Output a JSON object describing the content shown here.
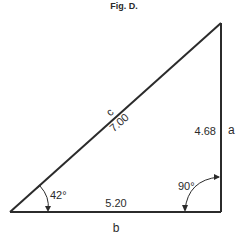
{
  "figure": {
    "title": "Fig. D."
  },
  "triangle": {
    "hypotenuse": {
      "letter": "c",
      "value": "7.00"
    },
    "vertical_side": {
      "letter": "a",
      "value": "4.68"
    },
    "base": {
      "letter": "b",
      "value": "5.20"
    },
    "angle_left": "42°",
    "angle_right": "90°"
  },
  "colors": {
    "line": "#2b2b2b",
    "background": "#ffffff"
  }
}
